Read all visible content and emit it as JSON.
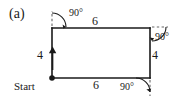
{
  "figure": {
    "panel_label": "(a)",
    "shape": "rectangle",
    "colors": {
      "stroke": "#1a1a1a",
      "dashed_ray": "#555555",
      "background": "#ffffff",
      "text": "#1a1a1a"
    },
    "start_point": {
      "label": "Start",
      "marker": "filled-dot",
      "position": "bottom-left-corner"
    },
    "direction_arrow": {
      "on_edge": "left",
      "points": "up"
    },
    "side_lengths": [
      {
        "id": "left",
        "value": "4",
        "edge": "left"
      },
      {
        "id": "top",
        "value": "6",
        "edge": "top"
      },
      {
        "id": "right",
        "value": "4",
        "edge": "right"
      },
      {
        "id": "bottom",
        "value": "6",
        "edge": "bottom"
      }
    ],
    "turn_angles": [
      {
        "id": "top-left",
        "value": "90°",
        "corner": "top-left"
      },
      {
        "id": "top-right",
        "value": "90°",
        "corner": "top-right"
      },
      {
        "id": "bottom-right",
        "value": "90°",
        "corner": "bottom-right"
      }
    ]
  }
}
